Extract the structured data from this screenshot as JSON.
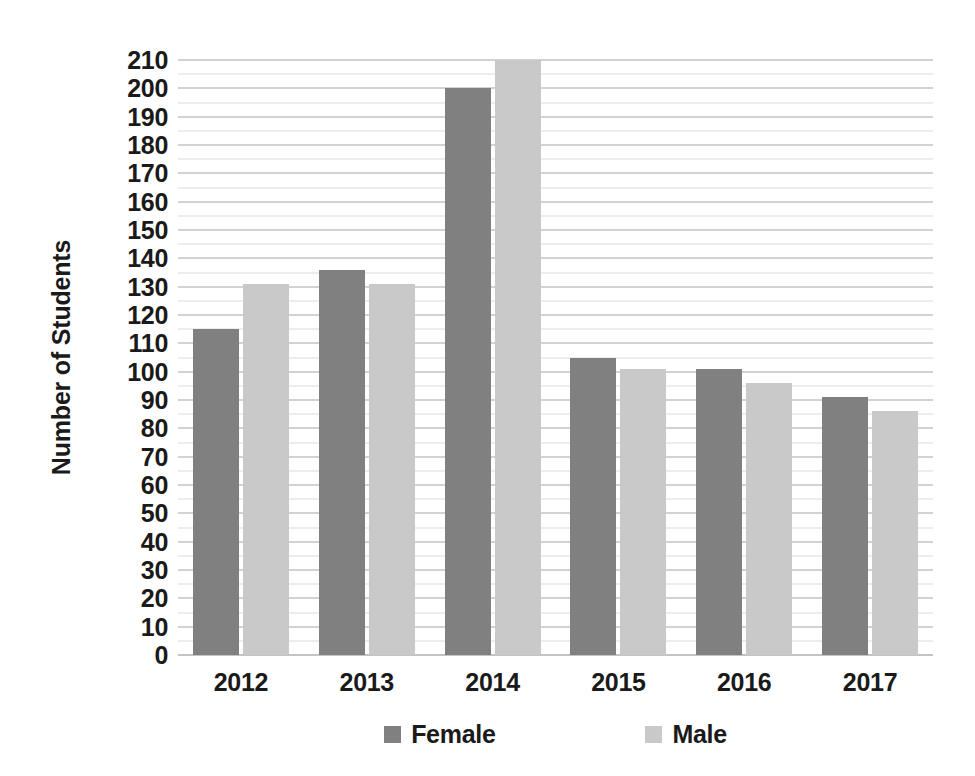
{
  "chart_data": {
    "type": "bar",
    "title": "",
    "xlabel": "",
    "ylabel": "Number of Students",
    "categories": [
      "2012",
      "2013",
      "2014",
      "2015",
      "2016",
      "2017"
    ],
    "series": [
      {
        "name": "Female",
        "color": "#808080",
        "values": [
          115,
          136,
          200,
          105,
          101,
          91
        ]
      },
      {
        "name": "Male",
        "color": "#c9c9c9",
        "values": [
          131,
          131,
          210,
          101,
          96,
          86
        ]
      }
    ],
    "ylim": [
      0,
      210
    ],
    "y_major_step": 10,
    "y_minor_step": 5,
    "y_tick_labels": [
      "210",
      "200",
      "190",
      "180",
      "170",
      "160",
      "150",
      "140",
      "130",
      "120",
      "110",
      "100",
      "90",
      "80",
      "70",
      "60",
      "50",
      "40",
      "30",
      "20",
      "10",
      "0"
    ],
    "grid": true,
    "grid_major_color": "#d2d2d2",
    "grid_minor_color": "#ededed",
    "legend_position": "bottom",
    "legend": [
      {
        "label": "Female",
        "color": "#808080"
      },
      {
        "label": "Male",
        "color": "#c9c9c9"
      }
    ],
    "background": "#ffffff",
    "text_color": "#1a1a1a"
  }
}
